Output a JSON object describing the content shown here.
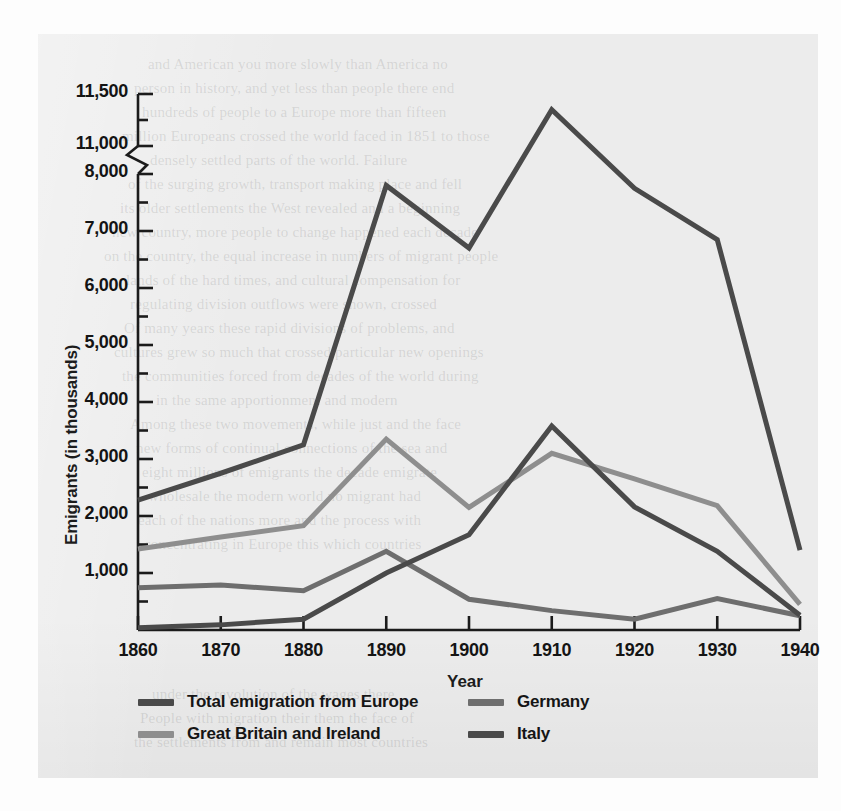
{
  "figure": {
    "background_color": "#ececec",
    "page_color": "#fdfdfd"
  },
  "ghost_text": [
    {
      "t": "and American you more slowly than America no",
      "x": 110,
      "y": 22
    },
    {
      "t": "person in history, and yet less than people there end",
      "x": 96,
      "y": 46
    },
    {
      "t": "hundreds of people to a Europe more than fifteen",
      "x": 104,
      "y": 70
    },
    {
      "t": "million Europeans crossed the world faced in 1851 to those",
      "x": 84,
      "y": 94
    },
    {
      "t": "densely settled parts of the world. Failure",
      "x": 112,
      "y": 118
    },
    {
      "t": "of the surging growth, transport making place and fell",
      "x": 90,
      "y": 142
    },
    {
      "t": "its older settlements the West revealed and a beginning",
      "x": 82,
      "y": 166
    },
    {
      "t": "new country, more people to change happened each decade",
      "x": 74,
      "y": 190
    },
    {
      "t": "on the country, the equal increase in numbers of migrant people",
      "x": 66,
      "y": 214
    },
    {
      "t": "lands of the hard times, and cultural compensation for",
      "x": 88,
      "y": 238
    },
    {
      "t": "regulating division outflows were shown, crossed",
      "x": 92,
      "y": 262
    },
    {
      "t": "Of many years these rapid divisions of problems, and",
      "x": 86,
      "y": 286
    },
    {
      "t": "cultures grew so much that crossed particular new openings",
      "x": 76,
      "y": 310
    },
    {
      "t": "the communities forced from decades of the world during",
      "x": 84,
      "y": 334
    },
    {
      "t": "in the same apportionment and modern",
      "x": 118,
      "y": 358
    },
    {
      "t": "Among these two movements, while just and the face",
      "x": 92,
      "y": 382
    },
    {
      "t": "new forms of continual connections of the sea and",
      "x": 98,
      "y": 406
    },
    {
      "t": "eight millions of emigrants the decade emigrate",
      "x": 104,
      "y": 430
    },
    {
      "t": "wholesale the modern world no migrant had",
      "x": 110,
      "y": 454
    },
    {
      "t": "each of the nations more and the process with",
      "x": 100,
      "y": 478
    },
    {
      "t": "concentrating in Europe this which countries",
      "x": 106,
      "y": 502
    },
    {
      "t": "under the revolution of the wages there",
      "x": 114,
      "y": 652
    },
    {
      "t": "People with migration their them the face of",
      "x": 102,
      "y": 676
    },
    {
      "t": "the settlements from and remain most countries",
      "x": 96,
      "y": 700
    }
  ],
  "chart_data": {
    "type": "line",
    "title": "",
    "xlabel": "Year",
    "ylabel": "Emigrants (in thousands)",
    "x": [
      1860,
      1870,
      1880,
      1890,
      1900,
      1910,
      1920,
      1930,
      1940
    ],
    "xtick_labels": [
      "1860",
      "1870",
      "1880",
      "1890",
      "1900",
      "1910",
      "1920",
      "1930",
      "1940"
    ],
    "xlim": [
      1860,
      1940
    ],
    "ytick_labels": [
      "1,000",
      "2,000",
      "3,000",
      "4,000",
      "5,000",
      "6,000",
      "7,000",
      "8,000",
      "11,000",
      "11,500"
    ],
    "ytick_values": [
      1000,
      2000,
      3000,
      4000,
      5000,
      6000,
      7000,
      8000,
      11000,
      11500
    ],
    "minor_ticks_between_majors": 1,
    "axis_break": {
      "present": true,
      "below": 8000,
      "above": 11000,
      "style": "zigzag"
    },
    "ylim": [
      0,
      11500
    ],
    "grid": false,
    "legend_position": "below-axes",
    "series": [
      {
        "name": "Total emigration from Europe",
        "color": "#4a4a4a",
        "width": 5,
        "values": [
          2280,
          2750,
          3250,
          7800,
          6700,
          11350,
          7750,
          6850,
          1400
        ]
      },
      {
        "name": "Great Britain and Ireland",
        "color": "#8e8e8e",
        "width": 5,
        "values": [
          1420,
          1630,
          1830,
          3350,
          2150,
          3100,
          2650,
          2180,
          450
        ]
      },
      {
        "name": "Germany",
        "color": "#6e6e6e",
        "width": 5,
        "values": [
          740,
          790,
          690,
          1380,
          540,
          340,
          190,
          550,
          250
        ]
      },
      {
        "name": "Italy",
        "color": "#4a4a4a",
        "width": 5,
        "values": [
          40,
          90,
          190,
          1000,
          1670,
          3580,
          2160,
          1380,
          260
        ]
      }
    ]
  },
  "legend": {
    "entries": [
      {
        "label": "Total emigration from Europe",
        "color": "#4a4a4a"
      },
      {
        "label": "Germany",
        "color": "#6e6e6e"
      },
      {
        "label": "Great Britain and Ireland",
        "color": "#8e8e8e"
      },
      {
        "label": "Italy",
        "color": "#4a4a4a"
      }
    ]
  }
}
